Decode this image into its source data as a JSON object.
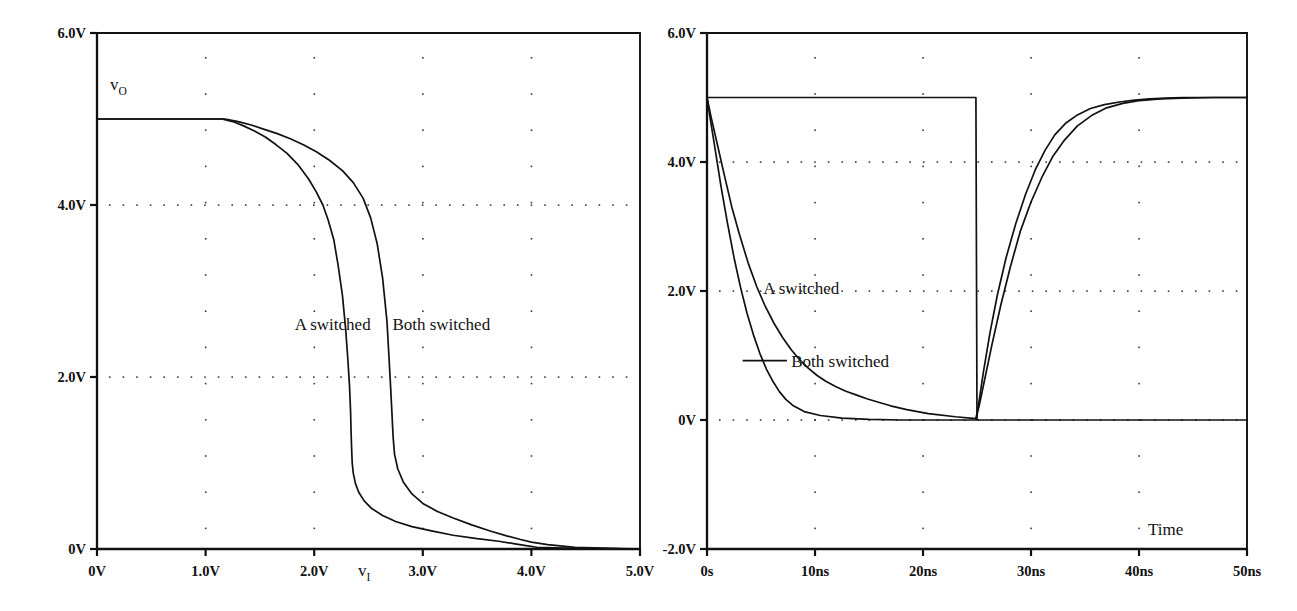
{
  "figure": {
    "background": "#ffffff",
    "ink": "#111111",
    "width": 1297,
    "height": 611
  },
  "chart_data": [
    {
      "id": "left-panel",
      "type": "line",
      "title": "",
      "subtitle": "",
      "xlabel": "v_I",
      "ylabel": "v_O",
      "xlabel_text": "v",
      "xlabel_sub": "I",
      "ylabel_text": "v",
      "ylabel_sub": "O",
      "grid": "dotted",
      "legend_position": "inline-annotations",
      "xlim": [
        0,
        5
      ],
      "ylim": [
        0,
        6
      ],
      "xticks": [
        0,
        1,
        2,
        3,
        4,
        5
      ],
      "xticklabels": [
        "0V",
        "1.0V",
        "2.0V",
        "3.0V",
        "4.0V",
        "5.0V"
      ],
      "yticks": [
        0,
        2,
        4,
        6
      ],
      "yticklabels": [
        "0V",
        "2.0V",
        "4.0V",
        "6.0V"
      ],
      "annotations": [
        {
          "name": "a-switched-label",
          "text": "A switched",
          "x": 1.82,
          "y": 2.62
        },
        {
          "name": "both-switched-label",
          "text": "Both switched",
          "x": 2.72,
          "y": 2.62
        }
      ],
      "series": [
        {
          "name": "A switched",
          "x": [
            0.0,
            1.15,
            1.25,
            1.35,
            1.45,
            1.55,
            1.65,
            1.75,
            1.85,
            1.95,
            2.02,
            2.08,
            2.13,
            2.18,
            2.22,
            2.26,
            2.29,
            2.31,
            2.325,
            2.335,
            2.34,
            2.345,
            2.35,
            2.36,
            2.38,
            2.41,
            2.46,
            2.53,
            2.63,
            2.75,
            2.9,
            3.08,
            3.28,
            3.5,
            3.7,
            3.85,
            3.95,
            4.05,
            4.3,
            5.0
          ],
          "y": [
            5.0,
            5.0,
            4.97,
            4.92,
            4.86,
            4.79,
            4.7,
            4.6,
            4.47,
            4.3,
            4.15,
            4.0,
            3.82,
            3.6,
            3.3,
            2.95,
            2.55,
            2.2,
            1.9,
            1.6,
            1.35,
            1.15,
            1.0,
            0.88,
            0.76,
            0.66,
            0.56,
            0.47,
            0.39,
            0.32,
            0.26,
            0.21,
            0.16,
            0.12,
            0.09,
            0.06,
            0.04,
            0.02,
            0.01,
            0.0
          ]
        },
        {
          "name": "Both switched",
          "x": [
            0.0,
            1.18,
            1.3,
            1.42,
            1.54,
            1.66,
            1.78,
            1.9,
            2.02,
            2.14,
            2.26,
            2.36,
            2.45,
            2.52,
            2.58,
            2.63,
            2.67,
            2.69,
            2.705,
            2.715,
            2.722,
            2.728,
            2.74,
            2.77,
            2.82,
            2.9,
            3.0,
            3.13,
            3.28,
            3.45,
            3.62,
            3.78,
            3.9,
            4.0,
            4.15,
            4.4,
            5.0
          ],
          "y": [
            5.0,
            5.0,
            4.97,
            4.93,
            4.88,
            4.83,
            4.77,
            4.7,
            4.62,
            4.52,
            4.4,
            4.26,
            4.08,
            3.85,
            3.55,
            3.15,
            2.65,
            2.2,
            1.85,
            1.6,
            1.42,
            1.28,
            1.1,
            0.93,
            0.78,
            0.64,
            0.53,
            0.44,
            0.36,
            0.28,
            0.21,
            0.15,
            0.11,
            0.08,
            0.05,
            0.02,
            0.0
          ]
        }
      ]
    },
    {
      "id": "right-panel",
      "type": "line",
      "title": "",
      "subtitle": "",
      "xlabel": "Time",
      "ylabel": "",
      "xlabel_text": "Time",
      "grid": "dotted",
      "legend_position": "inline-annotations",
      "xlim": [
        0,
        50
      ],
      "ylim": [
        -2,
        6
      ],
      "xticks": [
        0,
        10,
        20,
        30,
        40,
        50
      ],
      "xticklabels": [
        "0s",
        "10ns",
        "20ns",
        "30ns",
        "40ns",
        "50ns"
      ],
      "yticks": [
        -2,
        0,
        2,
        4,
        6
      ],
      "yticklabels": [
        "-2.0V",
        "0V",
        "2.0V",
        "4.0V",
        "6.0V"
      ],
      "annotations": [
        {
          "name": "a-switched-label",
          "text": "A switched",
          "x": 5.2,
          "y": 2.05
        },
        {
          "name": "both-switched-label",
          "text": "Both switched",
          "x": 7.8,
          "y": 0.92,
          "leader_from_x": 3.3,
          "leader_to_x": 7.4,
          "leader_y": 0.92
        }
      ],
      "series": [
        {
          "name": "Input pulse",
          "x": [
            0,
            0.1,
            24.9,
            25.0,
            25.1,
            50
          ],
          "y": [
            5.0,
            5.0,
            5.0,
            0.0,
            0.0,
            0.0
          ]
        },
        {
          "name": "Both switched",
          "x": [
            0.0,
            0.35,
            0.8,
            1.3,
            1.9,
            2.5,
            3.1,
            3.7,
            4.3,
            4.9,
            5.5,
            6.1,
            6.7,
            7.3,
            8.0,
            9.0,
            10.5,
            12.5,
            15.0,
            18.0,
            22.0,
            24.9,
            25.2,
            25.6,
            26.2,
            26.9,
            27.7,
            28.6,
            29.5,
            30.4,
            31.3,
            32.2,
            33.2,
            34.3,
            35.5,
            36.8,
            38.2,
            39.6,
            41.0,
            42.5,
            44.0,
            46.0,
            50.0
          ],
          "y": [
            5.0,
            4.62,
            4.15,
            3.62,
            3.05,
            2.52,
            2.06,
            1.66,
            1.32,
            1.03,
            0.79,
            0.6,
            0.44,
            0.32,
            0.22,
            0.13,
            0.07,
            0.03,
            0.01,
            0.0,
            0.0,
            0.0,
            0.3,
            0.75,
            1.35,
            1.95,
            2.52,
            3.05,
            3.5,
            3.88,
            4.18,
            4.42,
            4.6,
            4.73,
            4.83,
            4.89,
            4.93,
            4.96,
            4.98,
            4.99,
            5.0,
            5.0,
            5.0
          ]
        },
        {
          "name": "A switched",
          "x": [
            0.0,
            0.4,
            0.95,
            1.6,
            2.3,
            3.0,
            3.8,
            4.6,
            5.4,
            6.2,
            7.0,
            7.8,
            8.6,
            9.4,
            10.2,
            11.0,
            11.9,
            12.8,
            13.8,
            14.8,
            15.8,
            17.0,
            18.5,
            20.5,
            23.0,
            24.9,
            25.2,
            25.7,
            26.4,
            27.2,
            28.1,
            29.0,
            30.0,
            31.0,
            32.0,
            33.1,
            34.3,
            35.6,
            37.0,
            38.5,
            40.0,
            42.0,
            44.0,
            47.0,
            50.0
          ],
          "y": [
            5.0,
            4.68,
            4.28,
            3.8,
            3.3,
            2.88,
            2.44,
            2.07,
            1.76,
            1.5,
            1.28,
            1.09,
            0.93,
            0.8,
            0.69,
            0.6,
            0.52,
            0.45,
            0.39,
            0.33,
            0.28,
            0.22,
            0.16,
            0.1,
            0.05,
            0.02,
            0.22,
            0.62,
            1.18,
            1.78,
            2.38,
            2.92,
            3.38,
            3.76,
            4.08,
            4.34,
            4.56,
            4.72,
            4.84,
            4.91,
            4.95,
            4.98,
            4.99,
            5.0,
            5.0
          ]
        }
      ]
    }
  ]
}
